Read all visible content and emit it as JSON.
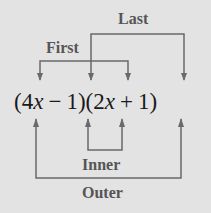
{
  "expression": {
    "full": "(4x − 1)(2x + 1)",
    "factor1": {
      "open": "(",
      "coef": "4",
      "var": "x",
      "op": "−",
      "const": "1",
      "close": ")"
    },
    "factor2": {
      "open": "(",
      "coef": "2",
      "var": "x",
      "op": "+",
      "const": "1",
      "close": ")"
    }
  },
  "labels": {
    "first": "First",
    "last": "Last",
    "inner": "Inner",
    "outer": "Outer"
  },
  "colors": {
    "background": "#e3e3e3",
    "label_text": "#555555",
    "expression_text": "#1a1a1a",
    "arrows": "#6a6a6a"
  },
  "brackets": [
    {
      "name": "First",
      "connects": [
        "4x",
        "2x"
      ],
      "position": "above"
    },
    {
      "name": "Last",
      "connects": [
        "−1",
        "+1"
      ],
      "position": "above"
    },
    {
      "name": "Inner",
      "connects": [
        "−1",
        "2x"
      ],
      "position": "below"
    },
    {
      "name": "Outer",
      "connects": [
        "4x",
        "+1"
      ],
      "position": "below"
    }
  ]
}
